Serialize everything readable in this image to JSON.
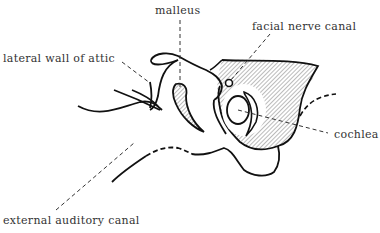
{
  "diagram": {
    "labels": {
      "malleus": "malleus",
      "facial_nerve_canal": "facial nerve canal",
      "lateral_wall_of_attic": "lateral wall of attic",
      "cochlea": "cochlea",
      "external_auditory_canal": "external auditory canal"
    }
  }
}
